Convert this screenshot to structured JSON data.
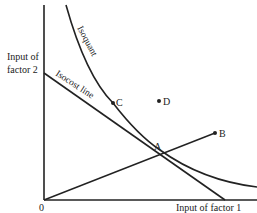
{
  "diagram": {
    "axes": {
      "x_label": "Input of factor 1",
      "y_label_line1": "Input of",
      "y_label_line2": "factor 2",
      "origin_label": "0"
    },
    "curves": {
      "isoquant_label": "Isoquant",
      "isocost_label": "Isocost line"
    },
    "points": {
      "A": "A",
      "B": "B",
      "C": "C",
      "D": "D"
    },
    "colors": {
      "line": "#222222",
      "background": "#ffffff"
    }
  }
}
